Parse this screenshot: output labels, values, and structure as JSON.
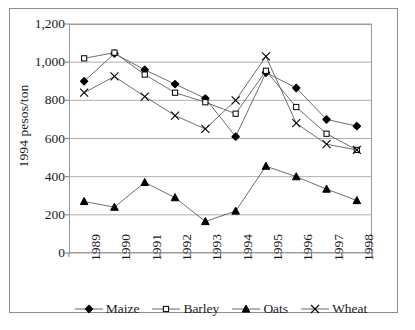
{
  "chart_data": {
    "type": "line",
    "title": "",
    "xlabel": "",
    "ylabel": "1994 pesos/ton",
    "categories": [
      "1989",
      "1990",
      "1991",
      "1992",
      "1993",
      "1994",
      "1995",
      "1996",
      "1997",
      "1998"
    ],
    "x": [
      1989,
      1990,
      1991,
      1992,
      1993,
      1994,
      1995,
      1996,
      1997,
      1998
    ],
    "ylim": [
      0,
      1200
    ],
    "yticks": [
      0,
      200,
      400,
      600,
      800,
      1000,
      1200
    ],
    "ytick_labels": [
      "0",
      "200",
      "400",
      "600",
      "800",
      "1,000",
      "1,200"
    ],
    "grid": "horizontal",
    "legend_position": "bottom",
    "series": [
      {
        "name": "Maize",
        "marker": "filled-diamond",
        "color": "#000000",
        "values": [
          900,
          1045,
          960,
          885,
          810,
          610,
          945,
          865,
          700,
          665
        ]
      },
      {
        "name": "Barley",
        "marker": "open-square",
        "color": "#000000",
        "values": [
          1020,
          1050,
          935,
          840,
          790,
          730,
          955,
          765,
          625,
          540
        ]
      },
      {
        "name": "Oats",
        "marker": "filled-triangle",
        "color": "#000000",
        "values": [
          270,
          240,
          370,
          290,
          165,
          220,
          455,
          400,
          335,
          275
        ]
      },
      {
        "name": "Wheat",
        "marker": "cross-x",
        "color": "#000000",
        "values": [
          840,
          925,
          820,
          720,
          650,
          800,
          1030,
          680,
          570,
          540
        ]
      }
    ]
  },
  "legend": {
    "items": [
      {
        "label": "Maize",
        "icon": "filled-diamond-icon"
      },
      {
        "label": "Barley",
        "icon": "open-square-icon"
      },
      {
        "label": "Oats",
        "icon": "filled-triangle-icon"
      },
      {
        "label": "Wheat",
        "icon": "cross-x-icon"
      }
    ]
  }
}
